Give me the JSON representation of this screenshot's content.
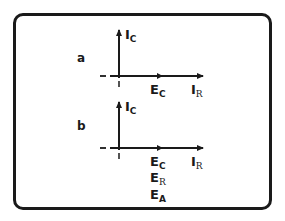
{
  "colors": {
    "ink": "#1a1a1a",
    "background": "#ffffff"
  },
  "panels": [
    {
      "letter": "a",
      "vertical_axis": {
        "main": "I",
        "sub": "C"
      },
      "horizontal_axis": {
        "main": "I",
        "sub": "R"
      },
      "phasor_labels": [
        {
          "main": "E",
          "sub": "C"
        }
      ]
    },
    {
      "letter": "b",
      "vertical_axis": {
        "main": "I",
        "sub": "C"
      },
      "horizontal_axis": {
        "main": "I",
        "sub": "R"
      },
      "phasor_labels": [
        {
          "main": "E",
          "sub": "C"
        },
        {
          "main": "E",
          "sub": "R"
        },
        {
          "main": "E",
          "sub": "A"
        }
      ]
    }
  ]
}
